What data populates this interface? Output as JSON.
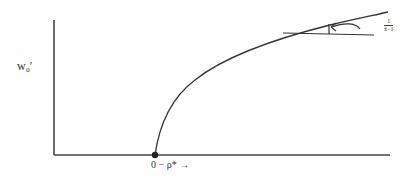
{
  "diagram": {
    "y_axis_label": "w₀′",
    "x_axis_label": "0 − ρ* →",
    "slope_label": {
      "numerator": "1",
      "denominator": "x̄−1"
    },
    "colors": {
      "line": "#333333",
      "background": "#ffffff"
    }
  }
}
